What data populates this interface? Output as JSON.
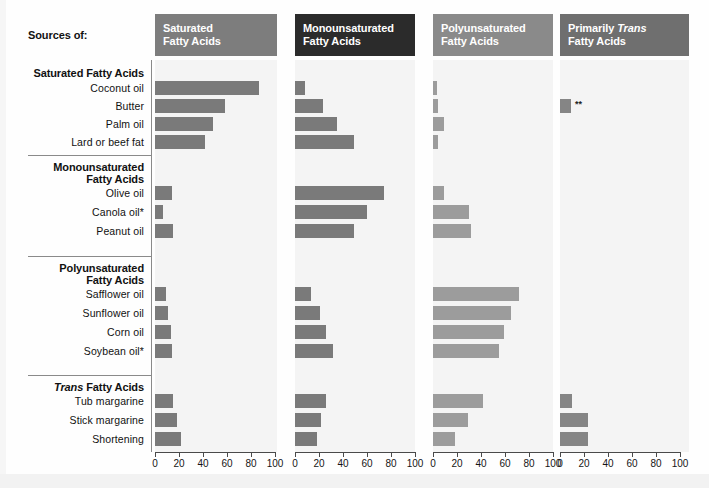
{
  "title_label": "Sources of:",
  "colors": {
    "panel_header_1": "#7d7d7d",
    "panel_header_2": "#2b2b2b",
    "panel_header_3": "#8a8a8a",
    "panel_header_4": "#6f6f6f",
    "bar_dark": "#7a7a7a",
    "bar_mid": "#858585",
    "bar_light": "#9c9c9c",
    "panel_bg": "#f4f4f4",
    "axis": "#4a4a4a",
    "text": "#111111"
  },
  "panels": [
    {
      "id": "saturated",
      "title_line1": "Saturated",
      "title_line2": "Fatty Acids",
      "italic_word": ""
    },
    {
      "id": "monounsaturated",
      "title_line1": "Monounsaturated",
      "title_line2": "Fatty Acids",
      "italic_word": ""
    },
    {
      "id": "polyunsaturated",
      "title_line1": "Polyunsaturated",
      "title_line2": "Fatty Acids",
      "italic_word": ""
    },
    {
      "id": "primarily-trans",
      "title_line1": "Primarily ",
      "title_line2": "Fatty Acids",
      "italic_word": "Trans"
    }
  ],
  "groups": [
    {
      "id": "saturated-group",
      "heading_line1": "Saturated Fatty Acids",
      "heading_line2": "",
      "heading_italic": "",
      "items": [
        "Coconut oil",
        "Butter",
        "Palm oil",
        "Lard or beef fat"
      ]
    },
    {
      "id": "monounsaturated-group",
      "heading_line1": "Monounsaturated",
      "heading_line2": "Fatty Acids",
      "heading_italic": "",
      "items": [
        "Olive oil",
        "Canola oil*",
        "Peanut oil"
      ]
    },
    {
      "id": "polyunsaturated-group",
      "heading_line1": "Polyunsaturated",
      "heading_line2": "Fatty Acids",
      "heading_italic": "",
      "items": [
        "Safflower oil",
        "Sunflower oil",
        "Corn oil",
        "Soybean oil*"
      ]
    },
    {
      "id": "trans-group",
      "heading_line1": "",
      "heading_line2": " Fatty Acids",
      "heading_italic": "Trans",
      "items": [
        "Tub margarine",
        "Stick margarine",
        "Shortening"
      ]
    }
  ],
  "axis": {
    "ticks": [
      0,
      20,
      40,
      60,
      80,
      100
    ],
    "min": 0,
    "max": 100,
    "tick_labels": [
      "0",
      "20",
      "40",
      "60",
      "80",
      "100"
    ]
  },
  "footnote_marker": "**",
  "chart_data": {
    "type": "bar",
    "xlabel": "",
    "ylabel": "",
    "xlim": [
      0,
      100
    ],
    "grid": false,
    "legend_position": "none",
    "orientation": "horizontal",
    "panel_names": [
      "Saturated Fatty Acids",
      "Monounsaturated Fatty Acids",
      "Polyunsaturated Fatty Acids",
      "Primarily Trans Fatty Acids"
    ],
    "categories": [
      "Coconut oil",
      "Butter",
      "Palm oil",
      "Lard or beef fat",
      "Olive oil",
      "Canola oil*",
      "Peanut oil",
      "Safflower oil",
      "Sunflower oil",
      "Corn oil",
      "Soybean oil*",
      "Tub margarine",
      "Stick margarine",
      "Shortening"
    ],
    "series": [
      {
        "name": "Saturated Fatty Acids",
        "values": [
          87,
          58,
          48,
          42,
          14,
          7,
          15,
          9,
          11,
          13,
          14,
          15,
          18,
          22
        ]
      },
      {
        "name": "Monounsaturated Fatty Acids",
        "values": [
          8,
          23,
          35,
          49,
          74,
          60,
          49,
          13,
          21,
          26,
          32,
          26,
          22,
          18
        ]
      },
      {
        "name": "Polyunsaturated Fatty Acids",
        "values": [
          3,
          4,
          9,
          4,
          9,
          30,
          32,
          72,
          65,
          59,
          55,
          42,
          29,
          18
        ]
      },
      {
        "name": "Primarily Trans Fatty Acids",
        "values": [
          0,
          9,
          0,
          0,
          0,
          0,
          0,
          0,
          0,
          0,
          0,
          10,
          23,
          23
        ]
      }
    ]
  }
}
